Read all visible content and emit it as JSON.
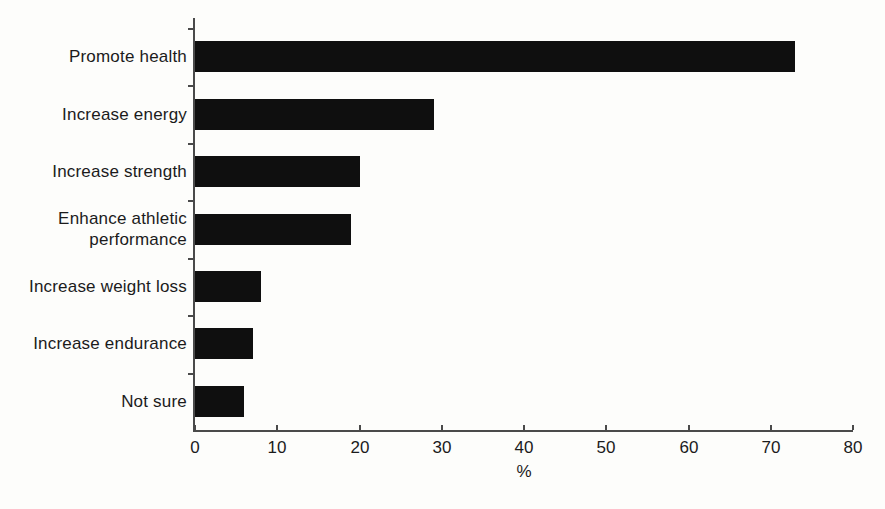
{
  "chart_data": {
    "type": "bar",
    "orientation": "horizontal",
    "title": "",
    "categories": [
      "Promote health",
      "Increase energy",
      "Increase strength",
      "Enhance athletic performance",
      "Increase weight loss",
      "Increase endurance",
      "Not sure"
    ],
    "values": [
      73,
      29,
      20,
      19,
      8,
      7,
      6
    ],
    "xlabel": "%",
    "ylabel": "",
    "xlim": [
      0,
      80
    ],
    "xticks": [
      0,
      10,
      20,
      30,
      40,
      50,
      60,
      70,
      80
    ],
    "grid": false,
    "legend": false,
    "bar_color": "#0f0f0f",
    "axis_color": "#4a4a4a",
    "text_color": "#1b1b1b",
    "background_color": "#fdfdfb"
  }
}
